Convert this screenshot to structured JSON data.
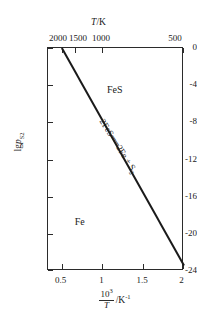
{
  "chart_data": {
    "type": "line",
    "title": "",
    "xlabel": "10^3/T / K^-1",
    "ylabel": "lg p_S2",
    "xlim": [
      0.33,
      2.0
    ],
    "ylim": [
      -24,
      0
    ],
    "grid": false,
    "legend_position": "none",
    "top_axis": {
      "label": "T/K",
      "label_parts": {
        "italic": "T",
        "rest": "/K"
      },
      "tick_labels": [
        "2000",
        "1500",
        "1000",
        "500"
      ],
      "tick_values": [
        2000,
        1500,
        1000,
        500
      ],
      "tick_x_recip": [
        0.5,
        0.667,
        1.0,
        2.0
      ]
    },
    "bottom_axis": {
      "tick_labels": [
        "0.5",
        "1",
        "1.5",
        "2"
      ],
      "tick_values": [
        0.5,
        1.0,
        1.5,
        2.0
      ],
      "label_numerator": "10",
      "label_numerator_exp": "3",
      "label_denominator": "T",
      "label_tail": "/K",
      "label_tail_exp": "-1"
    },
    "left_axis": {
      "tick_labels": [
        "0",
        "-4",
        "-8",
        "-12",
        "-16",
        "-20",
        "-24"
      ],
      "tick_values": [
        0,
        -4,
        -8,
        -12,
        -16,
        -20,
        -24
      ],
      "label_prefix": "lg",
      "label_italic": "p",
      "label_sub": "S",
      "label_sub_sub": "2"
    },
    "series": [
      {
        "name": "2FeS = 2Fe + S2 equilibrium",
        "x": [
          0.5,
          2.0
        ],
        "y": [
          0.0,
          -23.4
        ],
        "color": "#1a1a1a",
        "line_width": 2
      }
    ],
    "region_labels": [
      {
        "text": "FeS",
        "x": 1.15,
        "y": -4.4
      },
      {
        "text": "Fe",
        "x": 0.72,
        "y": -18.6
      }
    ],
    "annotations": [
      {
        "name": "reaction-equation",
        "parts": {
          "left": "2FeS",
          "equals": "══",
          "right_a": "2Fe + S",
          "right_sub": "2"
        },
        "x": 1.18,
        "y": -10.6,
        "rotation_deg": 57.5
      }
    ]
  }
}
